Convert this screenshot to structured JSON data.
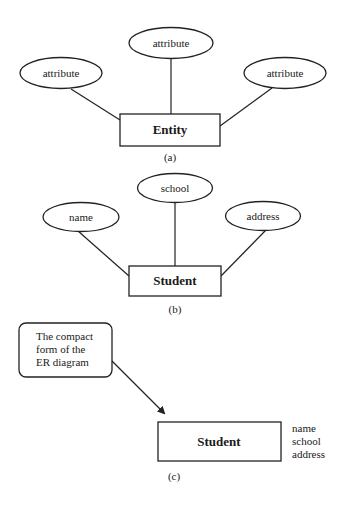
{
  "diagram_a": {
    "entity_label": "Entity",
    "attributes": [
      "attribute",
      "attribute",
      "attribute"
    ],
    "caption": "(a)"
  },
  "diagram_b": {
    "entity_label": "Student",
    "attributes": [
      "name",
      "school",
      "address"
    ],
    "caption": "(b)"
  },
  "diagram_c": {
    "callout_lines": [
      "The compact",
      "form of the",
      "ER diagram"
    ],
    "entity_label": "Student",
    "attribute_list": [
      "name",
      "school",
      "address"
    ],
    "caption": "(c)"
  },
  "colors": {
    "stroke": "#222222",
    "text": "#1a1a1a",
    "background": "#ffffff"
  }
}
